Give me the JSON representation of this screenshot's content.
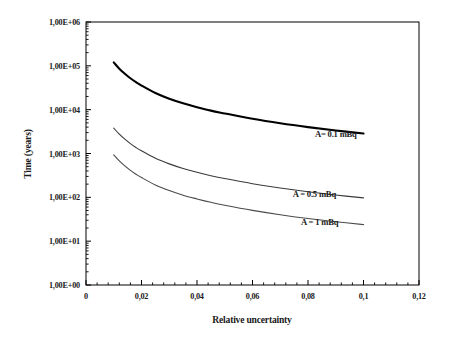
{
  "chart_data": {
    "type": "line",
    "title": "",
    "xlabel": "Relative uncertainty",
    "ylabel": "Time (years)",
    "xlim": [
      0,
      0.12
    ],
    "ylim": [
      1,
      1000000
    ],
    "yscale": "log",
    "xscale": "linear",
    "grid": false,
    "legend_position": "inline-annotations",
    "xticks": [
      "0",
      "0,02",
      "0,04",
      "0,06",
      "0,08",
      "0,1",
      "0,12"
    ],
    "xtick_values": [
      0,
      0.02,
      0.04,
      0.06,
      0.08,
      0.1,
      0.12
    ],
    "yticks": [
      "1,00E+00",
      "1,00E+01",
      "1,00E+02",
      "1,00E+03",
      "1,00E+04",
      "1,00E+05",
      "1,00E+06"
    ],
    "ytick_values": [
      1,
      10,
      100,
      1000,
      10000,
      100000,
      1000000
    ],
    "x_minor_ticks_per_major": 4,
    "y_minor_ticks": "log-decade",
    "series": [
      {
        "name": "A= 0.1 mBq",
        "color": "#000000",
        "width": 2.1,
        "label_x": 0.0825,
        "label_y": 2600,
        "x": [
          0.01,
          0.012,
          0.014,
          0.016,
          0.018,
          0.02,
          0.025,
          0.03,
          0.035,
          0.04,
          0.045,
          0.05,
          0.06,
          0.07,
          0.08,
          0.09,
          0.1
        ],
        "y": [
          120000,
          86000,
          66000,
          52000,
          42500,
          35500,
          24000,
          17800,
          14000,
          11400,
          9500,
          8200,
          6200,
          4900,
          4000,
          3350,
          2850
        ]
      },
      {
        "name": "A = 0.5 mBq",
        "color": "#3a3a3a",
        "width": 1.1,
        "label_x": 0.0745,
        "label_y": 115,
        "x": [
          0.01,
          0.012,
          0.014,
          0.016,
          0.018,
          0.02,
          0.025,
          0.03,
          0.035,
          0.04,
          0.045,
          0.05,
          0.06,
          0.07,
          0.08,
          0.09,
          0.1
        ],
        "y": [
          3800,
          2760,
          2120,
          1680,
          1370,
          1150,
          780,
          580,
          455,
          372,
          312,
          268,
          205,
          163,
          134,
          113,
          97
        ]
      },
      {
        "name": "A = 1 mBq",
        "color": "#4a4a4a",
        "width": 1.1,
        "label_x": 0.0775,
        "label_y": 26,
        "x": [
          0.01,
          0.012,
          0.014,
          0.016,
          0.018,
          0.02,
          0.025,
          0.03,
          0.035,
          0.04,
          0.045,
          0.05,
          0.06,
          0.07,
          0.08,
          0.09,
          0.1
        ],
        "y": [
          930,
          675,
          520,
          412,
          337,
          282,
          192,
          143,
          112,
          92,
          77,
          66,
          50.5,
          40.2,
          33.0,
          27.8,
          23.8
        ]
      }
    ]
  },
  "axes": {
    "frame_color": "#000000",
    "tick_color": "#000000"
  }
}
